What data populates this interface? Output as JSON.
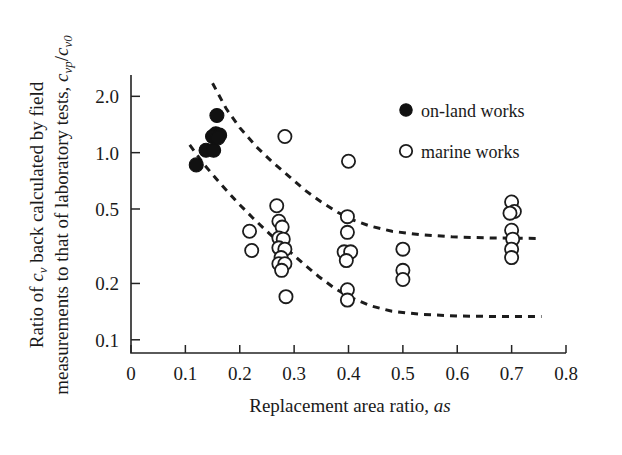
{
  "chart_data": {
    "type": "scatter",
    "title": "",
    "xlabel": "Replacement area ratio, as",
    "xlabel_plain": "Replacement area ratio, ",
    "xlabel_italic": "as",
    "ylabel": "Ratio of cv back calculated by field measurements to that of laboratory tests, cvp/cv0",
    "ylabel_line1_a": "Ratio of ",
    "ylabel_line1_b": "c",
    "ylabel_line1_c": "v",
    "ylabel_line1_d": " back calculated by field",
    "ylabel_line2_a": "measurements to that of laboratory tests, ",
    "ylabel_line2_b": "c",
    "ylabel_line2_c": "vp",
    "ylabel_line2_d": "/",
    "ylabel_line2_e": "c",
    "ylabel_line2_f": "v0",
    "xscale": "linear",
    "yscale": "log",
    "xlim": [
      0,
      0.8
    ],
    "ylim": [
      0.085,
      2.6
    ],
    "grid": false,
    "xticks": [
      0,
      0.1,
      0.2,
      0.3,
      0.4,
      0.5,
      0.6,
      0.7,
      0.8
    ],
    "xticklabels": [
      "0",
      "0.1",
      "0.2",
      "0.3",
      "0.4",
      "0.5",
      "0.6",
      "0.7",
      "0.8"
    ],
    "yticks": [
      2.0,
      1.0,
      0.5,
      0.2,
      0.1
    ],
    "yticklabels": [
      "2.0",
      "1.0",
      "0.5",
      "0.2",
      "0.1"
    ],
    "legend_position": "upper-right",
    "series": [
      {
        "name": "on-land works",
        "marker": "filled-circle",
        "color": "#111111",
        "points": [
          [
            0.12,
            0.86
          ],
          [
            0.138,
            1.03
          ],
          [
            0.152,
            1.03
          ],
          [
            0.158,
            1.58
          ],
          [
            0.156,
            1.26
          ],
          [
            0.163,
            1.24
          ],
          [
            0.15,
            1.22
          ],
          [
            0.16,
            1.2
          ]
        ]
      },
      {
        "name": "marine works",
        "marker": "open-circle",
        "color": "#1c1c1c",
        "points": [
          [
            0.218,
            0.38
          ],
          [
            0.222,
            0.3
          ],
          [
            0.268,
            0.52
          ],
          [
            0.272,
            0.43
          ],
          [
            0.278,
            0.4
          ],
          [
            0.272,
            0.35
          ],
          [
            0.28,
            0.345
          ],
          [
            0.272,
            0.31
          ],
          [
            0.283,
            0.305
          ],
          [
            0.276,
            0.275
          ],
          [
            0.272,
            0.255
          ],
          [
            0.283,
            0.255
          ],
          [
            0.277,
            0.235
          ],
          [
            0.285,
            0.17
          ],
          [
            0.283,
            1.22
          ],
          [
            0.4,
            0.9
          ],
          [
            0.398,
            0.455
          ],
          [
            0.398,
            0.375
          ],
          [
            0.392,
            0.295
          ],
          [
            0.404,
            0.295
          ],
          [
            0.396,
            0.265
          ],
          [
            0.398,
            0.185
          ],
          [
            0.398,
            0.163
          ],
          [
            0.5,
            0.305
          ],
          [
            0.5,
            0.235
          ],
          [
            0.5,
            0.21
          ],
          [
            0.7,
            0.545
          ],
          [
            0.705,
            0.485
          ],
          [
            0.697,
            0.475
          ],
          [
            0.7,
            0.385
          ],
          [
            0.702,
            0.345
          ],
          [
            0.7,
            0.305
          ],
          [
            0.7,
            0.275
          ]
        ]
      }
    ],
    "envelopes": [
      {
        "name": "upper-bound",
        "style": "dashed",
        "points": [
          [
            0.15,
            2.35
          ],
          [
            0.175,
            1.72
          ],
          [
            0.2,
            1.36
          ],
          [
            0.23,
            1.08
          ],
          [
            0.26,
            0.89
          ],
          [
            0.29,
            0.75
          ],
          [
            0.32,
            0.63
          ],
          [
            0.35,
            0.545
          ],
          [
            0.38,
            0.48
          ],
          [
            0.41,
            0.435
          ],
          [
            0.44,
            0.405
          ],
          [
            0.48,
            0.38
          ],
          [
            0.53,
            0.365
          ],
          [
            0.59,
            0.355
          ],
          [
            0.66,
            0.35
          ],
          [
            0.75,
            0.348
          ]
        ]
      },
      {
        "name": "lower-bound",
        "style": "dashed",
        "points": [
          [
            0.108,
            1.1
          ],
          [
            0.135,
            0.86
          ],
          [
            0.165,
            0.68
          ],
          [
            0.195,
            0.545
          ],
          [
            0.225,
            0.445
          ],
          [
            0.255,
            0.368
          ],
          [
            0.285,
            0.308
          ],
          [
            0.315,
            0.258
          ],
          [
            0.345,
            0.218
          ],
          [
            0.375,
            0.188
          ],
          [
            0.405,
            0.168
          ],
          [
            0.44,
            0.152
          ],
          [
            0.48,
            0.142
          ],
          [
            0.53,
            0.137
          ],
          [
            0.6,
            0.134
          ],
          [
            0.69,
            0.133
          ],
          [
            0.755,
            0.133
          ]
        ]
      }
    ],
    "legend": [
      {
        "label": "on-land works",
        "marker": "filled-circle"
      },
      {
        "label": "marine works",
        "marker": "open-circle"
      }
    ]
  }
}
